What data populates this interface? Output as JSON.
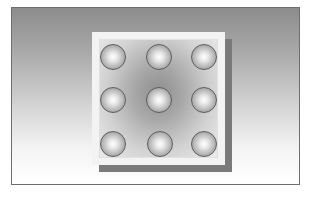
{
  "figure": {
    "type": "3x3 sphere grid on square tile with drop shadow",
    "colors": {
      "frame_border": "#6e6e6e",
      "background_top": "#8c8c8c",
      "background_bottom": "#ffffff",
      "tile": "#f3f3f3",
      "tile_shadow": "#7a7a7a",
      "sphere_edge": "#5d5d5d"
    },
    "grid": {
      "rows": 3,
      "cols": 3
    },
    "spheres": [
      {
        "row": 1,
        "col": 1,
        "x": 100,
        "y": 44
      },
      {
        "row": 1,
        "col": 2,
        "x": 146,
        "y": 44
      },
      {
        "row": 1,
        "col": 3,
        "x": 191,
        "y": 44
      },
      {
        "row": 2,
        "col": 1,
        "x": 100,
        "y": 87
      },
      {
        "row": 2,
        "col": 2,
        "x": 146,
        "y": 87
      },
      {
        "row": 2,
        "col": 3,
        "x": 191,
        "y": 87
      },
      {
        "row": 3,
        "col": 1,
        "x": 100,
        "y": 131
      },
      {
        "row": 3,
        "col": 2,
        "x": 147,
        "y": 131
      },
      {
        "row": 3,
        "col": 3,
        "x": 191,
        "y": 131
      }
    ]
  },
  "caption": {
    "text": ""
  }
}
